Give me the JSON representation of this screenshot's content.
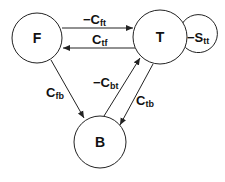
{
  "diagram": {
    "type": "state-transition",
    "colors": {
      "stroke": "#222222",
      "text": "#111111",
      "background": "#ffffff"
    },
    "nodes": [
      {
        "id": "F",
        "label": "F"
      },
      {
        "id": "T",
        "label": "T"
      },
      {
        "id": "B",
        "label": "B"
      }
    ],
    "edges": [
      {
        "from": "F",
        "to": "T",
        "prefix": "−C",
        "sub": "ft"
      },
      {
        "from": "T",
        "to": "F",
        "prefix": "C",
        "sub": "tf"
      },
      {
        "from": "F",
        "to": "B",
        "prefix": "C",
        "sub": "fb"
      },
      {
        "from": "B",
        "to": "T",
        "prefix": "−C",
        "sub": "bt"
      },
      {
        "from": "T",
        "to": "B",
        "prefix": "C",
        "sub": "tb"
      },
      {
        "from": "T",
        "to": "T",
        "prefix": "−S",
        "sub": "tt"
      }
    ]
  }
}
